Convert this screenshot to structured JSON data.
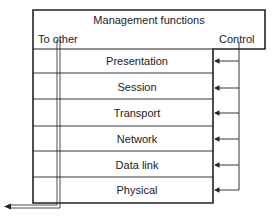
{
  "diagram": {
    "header": {
      "title": "Management functions",
      "left_label": "To other",
      "right_label": "Control"
    },
    "layers": [
      {
        "label": "Presentation"
      },
      {
        "label": "Session"
      },
      {
        "label": "Transport"
      },
      {
        "label": "Network"
      },
      {
        "label": "Data link"
      },
      {
        "label": "Physical"
      }
    ],
    "colors": {
      "line": "#222222",
      "background": "#ffffff"
    }
  }
}
